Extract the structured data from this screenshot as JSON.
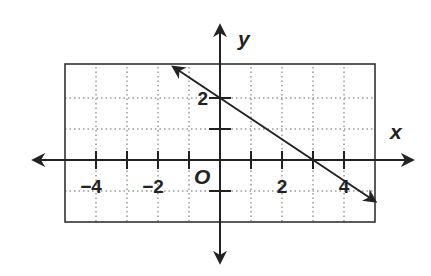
{
  "chart_data": {
    "type": "line",
    "title": "",
    "xlabel": "x",
    "ylabel": "y",
    "origin_label": "O",
    "xlim": [
      -5,
      5
    ],
    "ylim": [
      -2,
      3
    ],
    "grid": true,
    "x_ticks": [
      -4,
      -3,
      -2,
      -1,
      1,
      2,
      3,
      4
    ],
    "y_ticks": [
      -1,
      1,
      2
    ],
    "x_tick_labels": [
      {
        "value": -4,
        "text": "−4"
      },
      {
        "value": -2,
        "text": "−2"
      },
      {
        "value": 2,
        "text": "2"
      },
      {
        "value": 4,
        "text": "4"
      }
    ],
    "y_tick_labels": [
      {
        "value": 2,
        "text": "2"
      }
    ],
    "series": [
      {
        "name": "line",
        "equation": "y = -2/3 x + 2",
        "slope": -0.6667,
        "intercept": 2,
        "x": [
          -1.5,
          5
        ],
        "y": [
          3,
          -1.33
        ],
        "arrows": "both",
        "color": "#222222"
      }
    ]
  }
}
